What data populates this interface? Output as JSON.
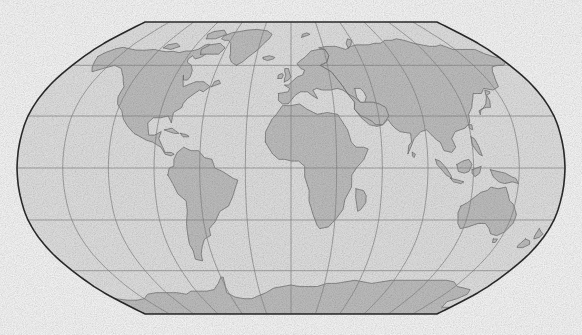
{
  "figure": {
    "kind": "world-map",
    "projection_name": "Robinson",
    "title": "",
    "subtitle": "",
    "caption": "",
    "background_color": "#ffffff",
    "width_px": 582,
    "height_px": 335
  },
  "map": {
    "frame": {
      "left_px": 17,
      "top_px": 22,
      "right_px": 565,
      "bottom_px": 314,
      "width_px": 548,
      "height_px": 292,
      "flat_edge_left_px": 130,
      "flat_edge_right_px": 450
    },
    "style": {
      "ocean_fill": "#e9e9e9",
      "land_fill": "#c6c6c6",
      "coastline_color": "#6e6e6e",
      "coastline_width_px": 0.7,
      "graticule_color": "#8a8a8a",
      "graticule_width_px": 0.7,
      "border_color": "#2c2c2c",
      "border_width_px": 1.6,
      "texture": "fine-stipple"
    },
    "graticule": {
      "visible": true,
      "parallel_interval_deg": 30,
      "meridian_interval_deg": 30,
      "parallels_deg": [
        60,
        30,
        0,
        -30,
        -60
      ],
      "meridians_deg": [
        -180,
        -150,
        -120,
        -90,
        -60,
        -30,
        0,
        30,
        60,
        90,
        120,
        150,
        180
      ],
      "central_meridian_deg": 0,
      "labels_visible": false,
      "equator_y_px": 168,
      "parallel_y_px": [
        61,
        117,
        168,
        219,
        275
      ]
    },
    "extent": {
      "lon_min_deg": -180,
      "lon_max_deg": 180,
      "lat_min_deg": -90,
      "lat_max_deg": 90
    },
    "features": [
      {
        "name": "North America",
        "fill": "#c6c6c6"
      },
      {
        "name": "Greenland",
        "fill": "#c6c6c6"
      },
      {
        "name": "South America",
        "fill": "#c6c6c6"
      },
      {
        "name": "Europe",
        "fill": "#c6c6c6"
      },
      {
        "name": "Africa",
        "fill": "#c6c6c6"
      },
      {
        "name": "Asia",
        "fill": "#c6c6c6"
      },
      {
        "name": "Australia",
        "fill": "#c6c6c6"
      },
      {
        "name": "Antarctica",
        "fill": "#c6c6c6"
      },
      {
        "name": "Madagascar",
        "fill": "#c6c6c6"
      },
      {
        "name": "New Guinea",
        "fill": "#c6c6c6"
      },
      {
        "name": "New Zealand",
        "fill": "#c6c6c6"
      },
      {
        "name": "Japan",
        "fill": "#c6c6c6"
      },
      {
        "name": "British Isles",
        "fill": "#c6c6c6"
      },
      {
        "name": "Iceland",
        "fill": "#c6c6c6"
      },
      {
        "name": "Borneo",
        "fill": "#c6c6c6"
      },
      {
        "name": "Sumatra",
        "fill": "#c6c6c6"
      },
      {
        "name": "Philippines",
        "fill": "#c6c6c6"
      },
      {
        "name": "Caspian Sea",
        "fill": "#e9e9e9"
      },
      {
        "name": "Sri Lanka",
        "fill": "#c6c6c6"
      },
      {
        "name": "Cuba",
        "fill": "#c6c6c6"
      },
      {
        "name": "Svalbard",
        "fill": "#c6c6c6"
      },
      {
        "name": "Tasmania",
        "fill": "#c6c6c6"
      }
    ],
    "alt_text": "Outline world map on a Robinson projection with gray landmasses, light gray oceans and a 30 degree graticule."
  }
}
